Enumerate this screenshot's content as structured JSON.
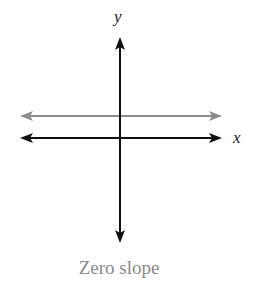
{
  "diagram": {
    "y_axis_label": "y",
    "x_axis_label": "x",
    "caption": "Zero slope",
    "colors": {
      "axes": "#111111",
      "horizontal_line": "#8c8c8c",
      "caption": "#8a8a8a"
    },
    "lines": [
      {
        "name": "horizontal line",
        "slope": 0,
        "color": "#8c8c8c"
      }
    ]
  }
}
